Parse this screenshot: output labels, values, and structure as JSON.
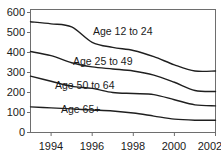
{
  "chart_data": {
    "type": "line",
    "title": "",
    "xlabel": "",
    "ylabel": "",
    "x": [
      1993,
      1994,
      1995,
      1996,
      1997,
      1998,
      1999,
      2000,
      2001,
      2002
    ],
    "xlim": [
      1993,
      2002
    ],
    "ylim": [
      0,
      600
    ],
    "yticks": [
      0,
      100,
      200,
      300,
      400,
      500,
      600
    ],
    "xticks": [
      1994,
      1996,
      1998,
      2000,
      2002
    ],
    "grid": false,
    "legend_position": "inline-labels",
    "series": [
      {
        "name": "Age 12 to 24",
        "values": [
          540,
          530,
          515,
          440,
          415,
          400,
          370,
          330,
          300,
          300
        ]
      },
      {
        "name": "Age 25 to 49",
        "values": [
          395,
          375,
          340,
          320,
          310,
          300,
          280,
          245,
          205,
          200
        ]
      },
      {
        "name": "Age 50 to 64",
        "values": [
          275,
          250,
          225,
          215,
          195,
          190,
          185,
          160,
          135,
          130
        ]
      },
      {
        "name": "Age 65+",
        "values": [
          125,
          120,
          115,
          110,
          105,
          95,
          80,
          65,
          60,
          60
        ]
      }
    ],
    "ytick_labels": [
      "600",
      "500",
      "400",
      "300",
      "200",
      "100",
      "0"
    ],
    "xtick_labels": [
      "1994",
      "1996",
      "1998",
      "2000",
      "2002"
    ],
    "annotations": [
      {
        "text": "Age 12 to 24",
        "x_px": 93,
        "y_px": 35
      },
      {
        "text": "Age 25 to 49",
        "x_px": 73,
        "y_px": 65
      },
      {
        "text": "Age 50 to 64",
        "x_px": 55,
        "y_px": 89
      },
      {
        "text": "Age 65+",
        "x_px": 61,
        "y_px": 113
      }
    ],
    "colors": {
      "line": "#1f1f1f",
      "axis": "#6e6e6e",
      "text": "#1a1a1a",
      "background": "#ffffff"
    }
  }
}
